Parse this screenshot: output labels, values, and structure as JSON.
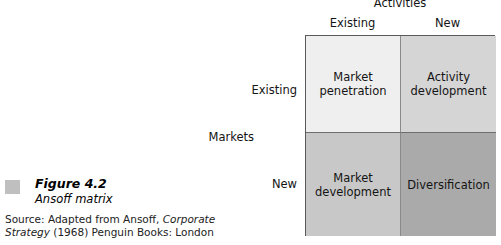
{
  "figure": {
    "marker_color": "#bfbfbf",
    "number": "Figure 4.2",
    "title": "Ansoff matrix",
    "source_prefix": "Source: Adapted from Ansoff, ",
    "source_italic": "Corporate Strategy",
    "source_suffix": " (1968) Penguin Books: London"
  },
  "axes": {
    "columns_axis_label": "Activities",
    "rows_axis_label": "Markets",
    "column_headers": [
      "Existing",
      "New"
    ],
    "row_headers": [
      "Existing",
      "New"
    ]
  },
  "chart_data": {
    "type": "table",
    "title": "Ansoff matrix",
    "xlabel": "Activities",
    "ylabel": "Markets",
    "x_categories": [
      "Existing",
      "New"
    ],
    "y_categories": [
      "Existing",
      "New"
    ],
    "grid": true,
    "legend": "none",
    "cells": [
      {
        "row": "Existing",
        "column": "Existing",
        "label_line1": "Market",
        "label_line2": "penetration",
        "fill": "#efefef"
      },
      {
        "row": "Existing",
        "column": "New",
        "label_line1": "Activity",
        "label_line2": "development",
        "fill": "#d5d5d5"
      },
      {
        "row": "New",
        "column": "Existing",
        "label_line1": "Market",
        "label_line2": "development",
        "fill": "#c8c8c8"
      },
      {
        "row": "New",
        "column": "New",
        "label_line1": "Diversification",
        "label_line2": "",
        "fill": "#aaaaaa"
      }
    ]
  }
}
